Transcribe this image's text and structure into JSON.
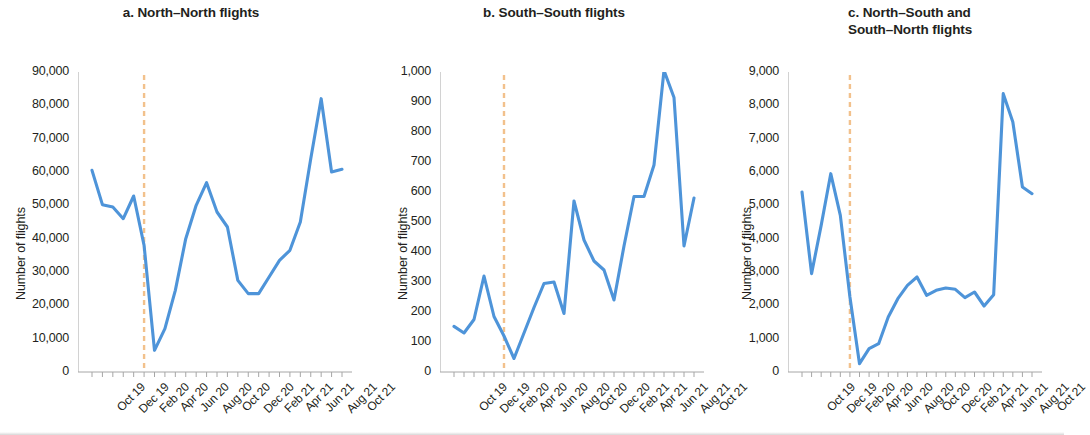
{
  "figure": {
    "background": "#ffffff",
    "series_color": "#4e94d9",
    "marker_color": "#f2c18c",
    "axis_color": "#a6a6a6",
    "text_color": "#231f20"
  },
  "panels": [
    {
      "id": "panel-a",
      "title": "a. North–North flights",
      "title_line2": "",
      "ylabel": "Number of flights",
      "yticks": [
        "0",
        "10,000",
        "20,000",
        "30,000",
        "40,000",
        "50,000",
        "60,000",
        "70,000",
        "80,000",
        "90,000"
      ],
      "xticks": [
        "Oct 19",
        "Dec 19",
        "Feb 20",
        "Apr 20",
        "Jun 20",
        "Aug 20",
        "Oct 20",
        "Dec 20",
        "Feb 21",
        "Apr 21",
        "Jun 21",
        "Aug 21",
        "Oct 21"
      ]
    },
    {
      "id": "panel-b",
      "title": "b. South–South flights",
      "title_line2": "",
      "ylabel": "Number of flights",
      "yticks": [
        "0",
        "100",
        "200",
        "300",
        "400",
        "500",
        "600",
        "700",
        "800",
        "900",
        "1,000"
      ],
      "xticks": [
        "Oct 19",
        "Dec 19",
        "Feb 20",
        "Apr 20",
        "Jun 20",
        "Aug 20",
        "Oct 20",
        "Dec 20",
        "Feb 21",
        "Apr 21",
        "Jun 21",
        "Aug 21",
        "Oct 21"
      ]
    },
    {
      "id": "panel-c",
      "title": "c. North–South and",
      "title_line2": "South–North flights",
      "ylabel": "Number of flights",
      "yticks": [
        "0",
        "1,000",
        "2,000",
        "3,000",
        "4,000",
        "5,000",
        "6,000",
        "7,000",
        "8,000",
        "9,000"
      ],
      "xticks": [
        "Oct 19",
        "Dec 19",
        "Feb 20",
        "Apr 20",
        "Jun 20",
        "Aug 20",
        "Oct 20",
        "Dec 20",
        "Feb 21",
        "Apr 21",
        "Jun 21",
        "Aug 21",
        "Oct 21"
      ]
    }
  ],
  "chart_data": [
    {
      "type": "line",
      "title": "a. North–North flights",
      "xlabel": "",
      "ylabel": "Number of flights",
      "ylim": [
        0,
        90000
      ],
      "ytick_step": 10000,
      "grid": false,
      "legend": "none",
      "x": [
        "Oct 19",
        "Nov 19",
        "Dec 19",
        "Jan 20",
        "Feb 20",
        "Mar 20",
        "Apr 20",
        "May 20",
        "Jun 20",
        "Jul 20",
        "Aug 20",
        "Sep 20",
        "Oct 20",
        "Nov 20",
        "Dec 20",
        "Jan 21",
        "Feb 21",
        "Mar 21",
        "Apr 21",
        "May 21",
        "Jun 21",
        "Jul 21",
        "Aug 21",
        "Sep 21",
        "Oct 21"
      ],
      "values": [
        60500,
        50200,
        49500,
        46000,
        52800,
        38000,
        6500,
        13000,
        24500,
        40000,
        50000,
        56800,
        48000,
        43500,
        27500,
        23500,
        23500,
        28500,
        33500,
        36500,
        45000,
        64000,
        82000,
        60000,
        60800
      ],
      "annotations": [
        {
          "type": "vline",
          "x": "Mar 20",
          "style": "dashed",
          "color": "#f2c18c",
          "label": "COVID-19 onset"
        }
      ]
    },
    {
      "type": "line",
      "title": "b. South–South flights",
      "xlabel": "",
      "ylabel": "Number of flights",
      "ylim": [
        0,
        1000
      ],
      "ytick_step": 100,
      "grid": false,
      "legend": "none",
      "x": [
        "Oct 19",
        "Nov 19",
        "Dec 19",
        "Jan 20",
        "Feb 20",
        "Mar 20",
        "Apr 20",
        "May 20",
        "Jun 20",
        "Jul 20",
        "Aug 20",
        "Sep 20",
        "Oct 20",
        "Nov 20",
        "Dec 20",
        "Jan 21",
        "Feb 21",
        "Mar 21",
        "Apr 21",
        "May 21",
        "Jun 21",
        "Jul 21",
        "Aug 21",
        "Sep 21",
        "Oct 21"
      ],
      "values": [
        152,
        130,
        175,
        320,
        185,
        120,
        45,
        130,
        215,
        295,
        300,
        195,
        570,
        440,
        370,
        340,
        240,
        420,
        585,
        585,
        690,
        1005,
        915,
        420,
        580
      ],
      "annotations": [
        {
          "type": "vline",
          "x": "Mar 20",
          "style": "dashed",
          "color": "#f2c18c",
          "label": "COVID-19 onset"
        }
      ]
    },
    {
      "type": "line",
      "title": "c. North–South and South–North flights",
      "xlabel": "",
      "ylabel": "Number of flights",
      "ylim": [
        0,
        9000
      ],
      "ytick_step": 1000,
      "grid": false,
      "legend": "none",
      "x": [
        "Oct 19",
        "Nov 19",
        "Dec 19",
        "Jan 20",
        "Feb 20",
        "Mar 20",
        "Apr 20",
        "May 20",
        "Jun 20",
        "Jul 20",
        "Aug 20",
        "Sep 20",
        "Oct 20",
        "Nov 20",
        "Dec 20",
        "Jan 21",
        "Feb 21",
        "Mar 21",
        "Apr 21",
        "May 21",
        "Jun 21",
        "Jul 21",
        "Aug 21",
        "Sep 21",
        "Oct 21"
      ],
      "values": [
        5400,
        2950,
        4400,
        5950,
        4700,
        2250,
        250,
        700,
        850,
        1650,
        2200,
        2600,
        2850,
        2300,
        2450,
        2520,
        2480,
        2230,
        2400,
        1980,
        2320,
        8350,
        7500,
        5550,
        5350
      ],
      "annotations": [
        {
          "type": "vline",
          "x": "Mar 20",
          "style": "dashed",
          "color": "#f2c18c",
          "label": "COVID-19 onset"
        }
      ]
    }
  ]
}
